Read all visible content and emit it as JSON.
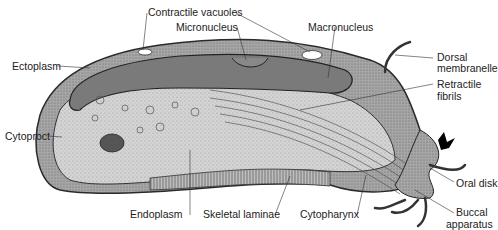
{
  "diagram": {
    "labels": {
      "contractile_vacuoles": "Contractile vacuoles",
      "micronucleus": "Micronucleus",
      "macronucleus": "Macronucleus",
      "ectoplasm": "Ectoplasm",
      "dorsal_membranelle_1": "Dorsal",
      "dorsal_membranelle_2": "membranelle",
      "retractile_fibrils_1": "Retractile",
      "retractile_fibrils_2": "fibrils",
      "cytoproct": "Cytoproct",
      "oral_disk": "Oral disk",
      "endoplasm": "Endoplasm",
      "skeletal_laminae": "Skeletal laminae",
      "cytopharynx": "Cytopharynx",
      "buccal_apparatus_1": "Buccal",
      "buccal_apparatus_2": "apparatus"
    },
    "colors": {
      "outline": "#2a2a2a",
      "macronucleus_fill": "#7a7a7a",
      "endoplasm_fill": "#d2d2d2",
      "ectoplasm_fill": "#a9a9a9",
      "background": "#ffffff"
    }
  }
}
